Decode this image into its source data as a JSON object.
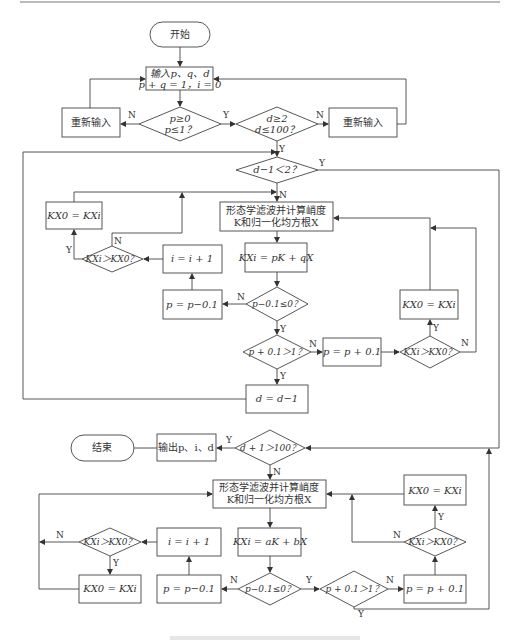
{
  "diagram": {
    "type": "flowchart",
    "top_rule": true,
    "nodes": {
      "start": "开始",
      "input_l1": "输入p、q、d",
      "input_l2": "p + q = 1，i = 0",
      "reinput_left": "重新输入",
      "reinput_right": "重新输入",
      "cond_p_l1": "p≥0",
      "cond_p_l2": "p≤1？",
      "cond_d_l1": "d≥2",
      "cond_d_l2": "d≤100？",
      "cond_d1": "d−1＜2？",
      "morph1_l1": "形态学滤波并计算峭度",
      "morph1_l2": "K和归一化均方根X",
      "kx_pq": "KXi = pK + qX",
      "cond_p01_top": "p−0.1≤0？",
      "p_minus_top": "p = p−0.1",
      "i_plus_top": "i = i + 1",
      "cmp_left_top": "KXi＞KX0？",
      "assign_left_top": "KX0 = KXi",
      "cond_p01_up_top": "p + 0.1＞1？",
      "p_plus_top": "p = p + 0.1",
      "cmp_right_top": "KXi＞KX0？",
      "assign_right_top": "KX0 = KXi",
      "d_minus": "d = d−1",
      "cond_d100": "d + 1＞100？",
      "output": "输出p、i、d",
      "end": "结束",
      "morph2_l1": "形态学滤波并计算峭度",
      "morph2_l2": "K和归一化均方根X",
      "kx_ab": "KXi = aK + bX",
      "cond_p01_bot": "p−0.1≤0？",
      "p_minus_bot": "p = p−0.1",
      "i_plus_bot": "i = i + 1",
      "cmp_left_bot": "KXi＞KX0？",
      "assign_left_bot": "KX0 = KXi",
      "cond_p01_up_bot": "p + 0.1＞1？",
      "p_plus_bot": "p = p + 0.1",
      "cmp_right_bot": "KXi＞KX0？",
      "assign_right_bot": "KX0 = KXi"
    },
    "edge_labels": {
      "yes": "Y",
      "no": "N"
    }
  }
}
